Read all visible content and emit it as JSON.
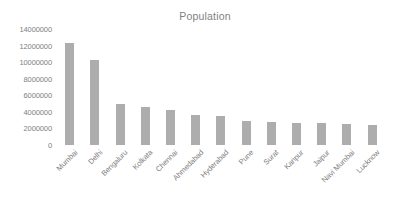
{
  "chart_data": {
    "type": "bar",
    "title": "Population",
    "xlabel": "",
    "ylabel": "",
    "ylim": [
      0,
      14000000
    ],
    "y_ticks": [
      0,
      2000000,
      4000000,
      6000000,
      8000000,
      10000000,
      12000000,
      14000000
    ],
    "y_tick_labels": [
      "0",
      "2000000",
      "4000000",
      "6000000",
      "8000000",
      "10000000",
      "12000000",
      "14000000"
    ],
    "grid": false,
    "legend": false,
    "bar_color": "#adadad",
    "text_color": "#808080",
    "background": "#ffffff",
    "categories": [
      "Mumbai",
      "Delhi",
      "Bengaluru",
      "Kolkata",
      "Chennai",
      "Ahmedabad",
      "Hyderabad",
      "Pune",
      "Surat",
      "Kanpur",
      "Jaipur",
      "Navi Mumbai",
      "Lucknow"
    ],
    "values": [
      12300000,
      10300000,
      4950000,
      4600000,
      4200000,
      3600000,
      3500000,
      2850000,
      2750000,
      2700000,
      2600000,
      2500000,
      2400000
    ],
    "series": [
      {
        "name": "Population",
        "values": [
          12300000,
          10300000,
          4950000,
          4600000,
          4200000,
          3600000,
          3500000,
          2850000,
          2750000,
          2700000,
          2600000,
          2500000,
          2400000
        ]
      }
    ]
  }
}
